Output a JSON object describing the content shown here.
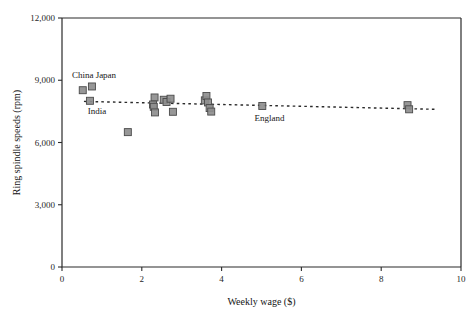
{
  "chart_data": {
    "type": "scatter",
    "title": "",
    "xlabel": "Weekly wage ($)",
    "ylabel": "Ring spindle speeds (rpm)",
    "xlim": [
      0,
      10
    ],
    "ylim": [
      0,
      12000
    ],
    "xticks": [
      0,
      2,
      4,
      6,
      8,
      10
    ],
    "xticklabels": [
      "0",
      "2",
      "4",
      "6",
      "8",
      "10"
    ],
    "yticks": [
      0,
      3000,
      6000,
      9000,
      12000
    ],
    "yticklabels": [
      "0",
      "3,000",
      "6,000",
      "9,000",
      "12,000"
    ],
    "grid": false,
    "legend": null,
    "marker": "square",
    "marker_color": "#8e8e8e",
    "marker_edge_color": "#4a4a4a",
    "points": [
      {
        "x": 0.52,
        "y": 8520
      },
      {
        "x": 0.75,
        "y": 8700
      },
      {
        "x": 0.7,
        "y": 8010
      },
      {
        "x": 1.65,
        "y": 6500
      },
      {
        "x": 2.32,
        "y": 8170
      },
      {
        "x": 2.28,
        "y": 7830
      },
      {
        "x": 2.3,
        "y": 7720
      },
      {
        "x": 2.33,
        "y": 7450
      },
      {
        "x": 2.55,
        "y": 8060
      },
      {
        "x": 2.62,
        "y": 7950
      },
      {
        "x": 2.72,
        "y": 8110
      },
      {
        "x": 2.78,
        "y": 7480
      },
      {
        "x": 3.58,
        "y": 8030
      },
      {
        "x": 3.62,
        "y": 8240
      },
      {
        "x": 3.66,
        "y": 7930
      },
      {
        "x": 3.7,
        "y": 7660
      },
      {
        "x": 3.74,
        "y": 7490
      },
      {
        "x": 5.02,
        "y": 7760
      },
      {
        "x": 8.66,
        "y": 7800
      },
      {
        "x": 8.7,
        "y": 7600
      }
    ],
    "trend": {
      "style": "dotted",
      "x0": 0.55,
      "y0": 7980,
      "x1": 9.35,
      "y1": 7600
    },
    "annotations": [
      {
        "label": "China",
        "x": 0.52,
        "y": 9100
      },
      {
        "label": "Japan",
        "x": 1.1,
        "y": 9130
      },
      {
        "label": "India",
        "x": 0.88,
        "y": 7350
      },
      {
        "label": "England",
        "x": 5.2,
        "y": 7030
      }
    ]
  }
}
